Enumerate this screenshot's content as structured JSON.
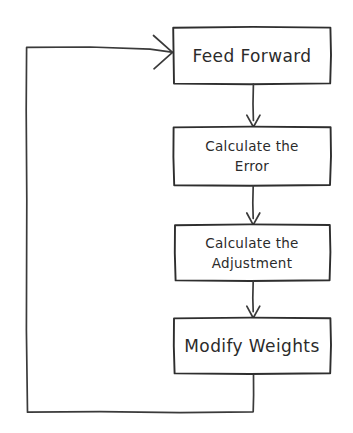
{
  "diagram": {
    "type": "flowchart",
    "orientation": "vertical-with-feedback-loop",
    "style": "hand-drawn sketch, black ink on white",
    "background_color": "#ffffff",
    "ink_color": "#2e2e2e",
    "nodes": [
      {
        "id": "feed-forward",
        "label": "Feed Forward",
        "lines": [
          "Feed Forward"
        ],
        "shape": "rectangle",
        "text_size": "large"
      },
      {
        "id": "calculate-the-error",
        "label": "Calculate the Error",
        "lines": [
          "Calculate the",
          "Error"
        ],
        "shape": "rectangle",
        "text_size": "small"
      },
      {
        "id": "calculate-the-adjustment",
        "label": "Calculate the Adjustment",
        "lines": [
          "Calculate the",
          "Adjustment"
        ],
        "shape": "rectangle",
        "text_size": "small"
      },
      {
        "id": "modify-weights",
        "label": "Modify Weights",
        "lines": [
          "Modify Weights"
        ],
        "shape": "rectangle",
        "text_size": "large"
      }
    ],
    "edges": [
      {
        "id": "edge-1",
        "from": "feed-forward",
        "to": "calculate-the-error",
        "arrow": "open-v",
        "direction": "down"
      },
      {
        "id": "edge-2",
        "from": "calculate-the-error",
        "to": "calculate-the-adjustment",
        "arrow": "open-v",
        "direction": "down"
      },
      {
        "id": "edge-3",
        "from": "calculate-the-adjustment",
        "to": "modify-weights",
        "arrow": "open-v",
        "direction": "down"
      },
      {
        "id": "edge-feedback",
        "from": "modify-weights",
        "to": "feed-forward",
        "arrow": "open-v",
        "direction": "loop-left-up"
      }
    ]
  }
}
